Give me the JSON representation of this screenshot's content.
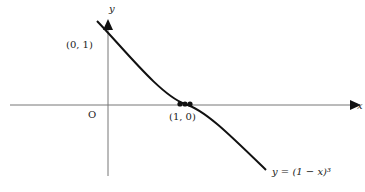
{
  "figure": {
    "function_label": "y = (1 − x)³",
    "axis_x_label": "x",
    "axis_y_label": "y",
    "origin_label": "O",
    "point_y_intercept": "(0, 1)",
    "point_x_intercept": "(1, 0)"
  },
  "colors": {
    "curve": "#111111",
    "axes": "#777777",
    "background": "#ffffff"
  }
}
